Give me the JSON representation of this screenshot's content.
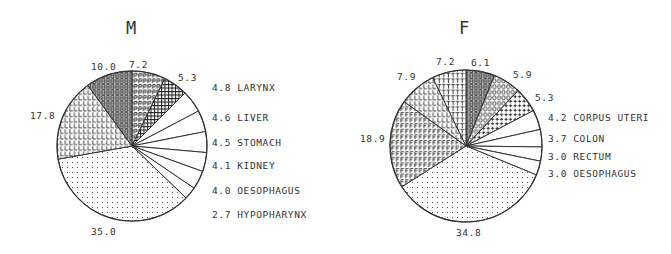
{
  "colors": {
    "ink": "#333333",
    "background": "#ffffff"
  },
  "chart_data": [
    {
      "type": "pie",
      "title": "M",
      "start_angle": "12 o'clock",
      "direction": "clockwise",
      "center": [
        132,
        146
      ],
      "radius": 75,
      "title_pos": [
        131,
        34
      ],
      "slices": [
        {
          "value": 7.2,
          "label": "7.2",
          "name": "",
          "pattern": "P",
          "label_pos": [
            129,
            68
          ],
          "anchor": "start"
        },
        {
          "value": 5.3,
          "label": "5.3",
          "name": "",
          "pattern": "grid",
          "label_pos": [
            178,
            81
          ],
          "anchor": "start"
        },
        {
          "value": 4.8,
          "label": "4.8 LARYNX",
          "name": "LARYNX",
          "pattern": "none",
          "label_pos": [
            212,
            91
          ],
          "anchor": "start"
        },
        {
          "value": 4.6,
          "label": "4.6 LIVER",
          "name": "LIVER",
          "pattern": "none",
          "label_pos": [
            212,
            121
          ],
          "anchor": "start"
        },
        {
          "value": 4.5,
          "label": "4.5 STOMACH",
          "name": "STOMACH",
          "pattern": "none",
          "label_pos": [
            212,
            146
          ],
          "anchor": "start"
        },
        {
          "value": 4.1,
          "label": "4.1 KIDNEY",
          "name": "KIDNEY",
          "pattern": "none",
          "label_pos": [
            212,
            169
          ],
          "anchor": "start"
        },
        {
          "value": 4.0,
          "label": "4.0 OESOPHAGUS",
          "name": "OESOPHAGUS",
          "pattern": "none",
          "label_pos": [
            212,
            194
          ],
          "anchor": "start"
        },
        {
          "value": 2.7,
          "label": "2.7 HYPOPHARYNX",
          "name": "HYPOPHARYNX",
          "pattern": "none",
          "label_pos": [
            212,
            218
          ],
          "anchor": "start"
        },
        {
          "value": 35.0,
          "label": "35.0",
          "name": "",
          "pattern": "dots",
          "label_pos": [
            91,
            235
          ],
          "anchor": "start"
        },
        {
          "value": 17.8,
          "label": "17.8",
          "name": "",
          "pattern": "L",
          "label_pos": [
            30,
            119
          ],
          "anchor": "start"
        },
        {
          "value": 10.0,
          "label": "10.0",
          "name": "",
          "pattern": "B",
          "label_pos": [
            91,
            70
          ],
          "anchor": "start"
        }
      ]
    },
    {
      "type": "pie",
      "title": "F",
      "start_angle": "12 o'clock",
      "direction": "clockwise",
      "center": [
        466,
        146
      ],
      "radius": 76,
      "title_pos": [
        464,
        34
      ],
      "slices": [
        {
          "value": 6.1,
          "label": "6.1",
          "name": "",
          "pattern": "B",
          "label_pos": [
            471,
            66
          ],
          "anchor": "start"
        },
        {
          "value": 5.9,
          "label": "5.9",
          "name": "",
          "pattern": "O",
          "label_pos": [
            513,
            78
          ],
          "anchor": "start"
        },
        {
          "value": 5.3,
          "label": "5.3",
          "name": "",
          "pattern": "plus",
          "label_pos": [
            535,
            101
          ],
          "anchor": "start"
        },
        {
          "value": 4.2,
          "label": "4.2 CORPUS UTERI",
          "name": "CORPUS UTERI",
          "pattern": "none",
          "label_pos": [
            548,
            121
          ],
          "anchor": "start"
        },
        {
          "value": 3.7,
          "label": "3.7 COLON",
          "name": "COLON",
          "pattern": "none",
          "label_pos": [
            548,
            142
          ],
          "anchor": "start"
        },
        {
          "value": 3.0,
          "label": "3.0 RECTUM",
          "name": "RECTUM",
          "pattern": "none",
          "label_pos": [
            548,
            160
          ],
          "anchor": "start"
        },
        {
          "value": 3.0,
          "label": "3.0 OESOPHAGUS",
          "name": "OESOPHAGUS",
          "pattern": "none",
          "label_pos": [
            548,
            177
          ],
          "anchor": "start"
        },
        {
          "value": 34.8,
          "label": "34.8",
          "name": "",
          "pattern": "dots",
          "label_pos": [
            456,
            236
          ],
          "anchor": "start"
        },
        {
          "value": 18.9,
          "label": "18.9",
          "name": "",
          "pattern": "F",
          "label_pos": [
            360,
            142
          ],
          "anchor": "start"
        },
        {
          "value": 7.9,
          "label": "7.9",
          "name": "",
          "pattern": "L",
          "label_pos": [
            397,
            80
          ],
          "anchor": "start"
        },
        {
          "value": 7.2,
          "label": "7.2",
          "name": "",
          "pattern": "T",
          "label_pos": [
            436,
            65
          ],
          "anchor": "start"
        }
      ]
    }
  ]
}
